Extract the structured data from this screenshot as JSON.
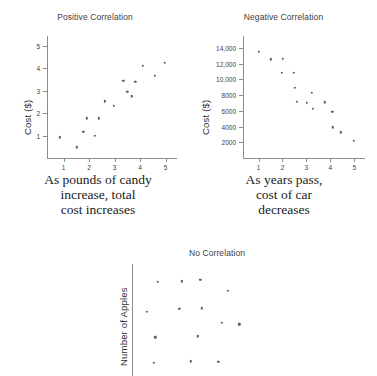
{
  "figure": {
    "panels": [
      {
        "id": "positive",
        "title": "Positive Correlation",
        "ylabel": "Cost ($)",
        "caption_lines": [
          "As pounds of candy",
          "increase, total",
          "cost increases"
        ]
      },
      {
        "id": "negative",
        "title": "Negative Correlation",
        "ylabel": "Cost ($)",
        "caption_lines": [
          "As years pass,",
          "cost of car",
          "decreases"
        ]
      },
      {
        "id": "none",
        "title": "No Correlation",
        "ylabel": "Number of Apples",
        "caption_lines": []
      }
    ]
  },
  "chart_data": [
    {
      "type": "scatter",
      "title": "Positive Correlation",
      "xlabel": "",
      "ylabel": "Cost ($)",
      "xlim": [
        0.35,
        5.45
      ],
      "ylim": [
        0,
        5.45
      ],
      "xticks": [
        1,
        2,
        3,
        4,
        5
      ],
      "yticks": [
        1,
        2,
        3,
        4,
        5
      ],
      "xtick_labels": [
        "1",
        "2",
        "3",
        "4",
        "5"
      ],
      "ytick_labels": [
        "1",
        "2",
        "3",
        "4",
        "5"
      ],
      "grid": false,
      "legend": false,
      "points": [
        [
          0.85,
          0.92
        ],
        [
          1.52,
          0.48
        ],
        [
          1.78,
          1.17
        ],
        [
          1.9,
          1.78
        ],
        [
          2.22,
          0.99
        ],
        [
          2.38,
          1.78
        ],
        [
          2.62,
          2.53
        ],
        [
          2.98,
          2.33
        ],
        [
          3.35,
          3.46
        ],
        [
          3.5,
          2.95
        ],
        [
          3.68,
          2.75
        ],
        [
          3.82,
          3.4
        ],
        [
          4.12,
          4.12
        ],
        [
          4.58,
          3.68
        ],
        [
          4.98,
          4.25
        ]
      ]
    },
    {
      "type": "scatter",
      "title": "Negative Correlation",
      "xlabel": "",
      "ylabel": "Cost ($)",
      "xlim": [
        0.35,
        5.45
      ],
      "ylim": [
        0,
        15500
      ],
      "xticks": [
        1,
        2,
        3,
        4,
        5
      ],
      "yticks": [
        2000,
        4000,
        6000,
        8000,
        10000,
        12000,
        14000
      ],
      "xtick_labels": [
        "1",
        "2",
        "3",
        "4",
        "5"
      ],
      "ytick_labels": [
        "2000",
        "4000",
        "6000",
        "8000",
        "10,000",
        "12,000",
        "14,000"
      ],
      "grid": false,
      "legend": false,
      "points": [
        [
          1.0,
          13500
        ],
        [
          1.5,
          12550
        ],
        [
          2.02,
          12580
        ],
        [
          1.98,
          10850
        ],
        [
          2.48,
          10830
        ],
        [
          2.52,
          8950
        ],
        [
          2.6,
          7150
        ],
        [
          3.22,
          8300
        ],
        [
          3.02,
          7000
        ],
        [
          3.28,
          6250
        ],
        [
          3.78,
          7100
        ],
        [
          4.08,
          5850
        ],
        [
          4.1,
          3900
        ],
        [
          4.45,
          3250
        ],
        [
          4.98,
          2150
        ]
      ]
    },
    {
      "type": "scatter",
      "title": "No Correlation",
      "xlabel": "",
      "ylabel": "Number of Apples",
      "xlim": [
        0,
        10
      ],
      "ylim": [
        0,
        10
      ],
      "xticks": [],
      "yticks": [],
      "xtick_labels": [],
      "ytick_labels": [],
      "grid": false,
      "legend": false,
      "points": [
        [
          1.7,
          8.4
        ],
        [
          3.3,
          8.45
        ],
        [
          4.55,
          8.6
        ],
        [
          6.4,
          7.6
        ],
        [
          1.0,
          5.75
        ],
        [
          3.15,
          6.0
        ],
        [
          4.65,
          6.05
        ],
        [
          6.0,
          4.75
        ],
        [
          7.15,
          4.6
        ],
        [
          1.55,
          3.45
        ],
        [
          4.4,
          3.55
        ],
        [
          1.45,
          1.2
        ],
        [
          3.9,
          1.3
        ],
        [
          5.75,
          1.25
        ]
      ]
    }
  ]
}
